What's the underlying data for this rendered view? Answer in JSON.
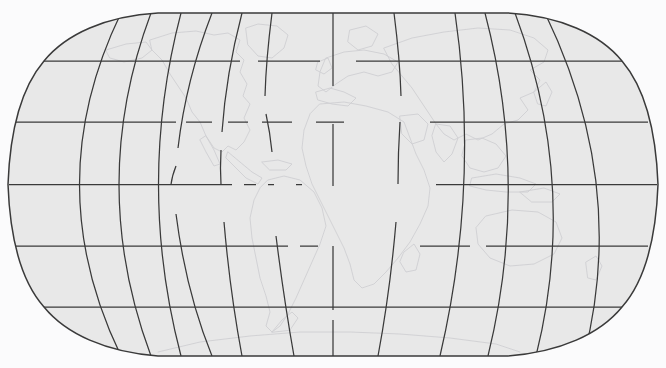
{
  "figure": {
    "kind": "world-map",
    "title": "",
    "projection": "pseudocylindrical-robinson",
    "canvas": {
      "width": 666,
      "height": 368
    },
    "colors": {
      "background": "#fbfbfc",
      "land_fill": "#e8e8e8",
      "map_outline": "#3a3a3a",
      "graticule": "#3a3a3a",
      "coastline": "#cfcfd2"
    },
    "bounds": {
      "left": 8,
      "right": 658,
      "top": 13,
      "bottom": 356,
      "center_x": 333,
      "equator_y": 184.5
    }
  },
  "chart_data": {
    "type": "map",
    "title": "",
    "subtitle": "",
    "xlabel": "",
    "ylabel": "",
    "grid": true,
    "legend": "none",
    "graticule": {
      "meridian_step_deg": 30,
      "parallel_step_deg": 30,
      "meridian_longitudes": [
        -180,
        -150,
        -120,
        -90,
        -60,
        -30,
        0,
        30,
        60,
        90,
        120,
        150,
        180
      ],
      "parallel_latitudes": [
        90,
        60,
        30,
        0,
        -30,
        -60,
        -90
      ],
      "meridian_x_at_equator": [
        8,
        62,
        116,
        170,
        224,
        279,
        333,
        388,
        442,
        497,
        551,
        605,
        658
      ],
      "parallel_y": [
        13,
        61,
        122,
        184.5,
        246,
        307,
        356
      ]
    },
    "parallel_half_widths": {
      "note": "half-width of map body in px at each parallel latitude",
      "90": 175,
      "60": 247,
      "30": 303,
      "0": 325,
      "-30": 303,
      "-60": 247,
      "-90": 175
    },
    "features": [
      "north-america",
      "south-america",
      "europe",
      "africa",
      "asia",
      "australia",
      "antarctica",
      "greenland"
    ]
  },
  "a11y": {
    "map_label": "World map outline with 30 degree graticule",
    "graticule_label": "Graticule of meridians and parallels",
    "coastlines_label": "Faint world coastlines",
    "outline_label": "Projection boundary outline"
  }
}
